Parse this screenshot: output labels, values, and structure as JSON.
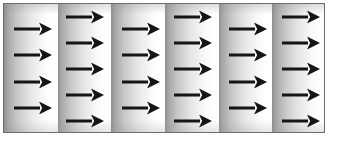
{
  "figure": {
    "kind": "vector-field-diagram",
    "title": "",
    "caption": "",
    "labels": [],
    "annotations": [],
    "frame": {
      "border_color": "#6e6e6e",
      "border_width_px": 1,
      "x_px": 3,
      "y_px": 3,
      "width_px": 322,
      "height_px": 130
    },
    "background": {
      "page_color": "#ffffff",
      "gradient_type": "repeating-linear-horizontal",
      "gradient_dark": "#8f8f8f",
      "gradient_light": "#ffffff",
      "gradient_period_px": 53.67,
      "gradient_repeats": 6
    },
    "arrow": {
      "color": "#151515",
      "direction": "right",
      "direction_degrees": 0,
      "length_px": 38,
      "head_height_px": 13,
      "shaft_height_px": 3,
      "icon": "arrow-right-icon"
    },
    "grid": {
      "columns": 6,
      "column_arrow_counts": [
        4,
        5,
        4,
        5,
        4,
        5
      ],
      "column_x_px": [
        13,
        65,
        121,
        173,
        228,
        281
      ],
      "column_offset_pattern": [
        "low",
        "high",
        "low",
        "high",
        "low",
        "high"
      ],
      "row_spacing_px": 26.4,
      "rows_low_y_px": [
        28,
        54,
        81,
        107
      ],
      "rows_high_y_px": [
        16,
        42,
        68,
        94,
        120
      ],
      "total_arrows": 27
    },
    "arrows": [
      {
        "column": 1,
        "row": 1,
        "x_px": 13,
        "y_px": 28,
        "angle_deg": 0
      },
      {
        "column": 1,
        "row": 2,
        "x_px": 13,
        "y_px": 54,
        "angle_deg": 0
      },
      {
        "column": 1,
        "row": 3,
        "x_px": 13,
        "y_px": 81,
        "angle_deg": 0
      },
      {
        "column": 1,
        "row": 4,
        "x_px": 13,
        "y_px": 107,
        "angle_deg": 0
      },
      {
        "column": 2,
        "row": 1,
        "x_px": 65,
        "y_px": 16,
        "angle_deg": 0
      },
      {
        "column": 2,
        "row": 2,
        "x_px": 65,
        "y_px": 42,
        "angle_deg": 0
      },
      {
        "column": 2,
        "row": 3,
        "x_px": 65,
        "y_px": 68,
        "angle_deg": 0
      },
      {
        "column": 2,
        "row": 4,
        "x_px": 65,
        "y_px": 94,
        "angle_deg": 0
      },
      {
        "column": 2,
        "row": 5,
        "x_px": 65,
        "y_px": 120,
        "angle_deg": 0
      },
      {
        "column": 3,
        "row": 1,
        "x_px": 121,
        "y_px": 28,
        "angle_deg": 0
      },
      {
        "column": 3,
        "row": 2,
        "x_px": 121,
        "y_px": 54,
        "angle_deg": 0
      },
      {
        "column": 3,
        "row": 3,
        "x_px": 121,
        "y_px": 81,
        "angle_deg": 0
      },
      {
        "column": 3,
        "row": 4,
        "x_px": 121,
        "y_px": 107,
        "angle_deg": 0
      },
      {
        "column": 4,
        "row": 1,
        "x_px": 173,
        "y_px": 16,
        "angle_deg": 0
      },
      {
        "column": 4,
        "row": 2,
        "x_px": 173,
        "y_px": 42,
        "angle_deg": 0
      },
      {
        "column": 4,
        "row": 3,
        "x_px": 173,
        "y_px": 68,
        "angle_deg": 0
      },
      {
        "column": 4,
        "row": 4,
        "x_px": 173,
        "y_px": 94,
        "angle_deg": 0
      },
      {
        "column": 4,
        "row": 5,
        "x_px": 173,
        "y_px": 120,
        "angle_deg": 0
      },
      {
        "column": 5,
        "row": 1,
        "x_px": 228,
        "y_px": 28,
        "angle_deg": 0
      },
      {
        "column": 5,
        "row": 2,
        "x_px": 228,
        "y_px": 54,
        "angle_deg": 0
      },
      {
        "column": 5,
        "row": 3,
        "x_px": 228,
        "y_px": 81,
        "angle_deg": 0
      },
      {
        "column": 5,
        "row": 4,
        "x_px": 228,
        "y_px": 107,
        "angle_deg": 0
      },
      {
        "column": 6,
        "row": 1,
        "x_px": 281,
        "y_px": 16,
        "angle_deg": 0
      },
      {
        "column": 6,
        "row": 2,
        "x_px": 281,
        "y_px": 42,
        "angle_deg": 0
      },
      {
        "column": 6,
        "row": 3,
        "x_px": 281,
        "y_px": 68,
        "angle_deg": 0
      },
      {
        "column": 6,
        "row": 4,
        "x_px": 281,
        "y_px": 94,
        "angle_deg": 0
      },
      {
        "column": 6,
        "row": 5,
        "x_px": 281,
        "y_px": 120,
        "angle_deg": 0
      }
    ]
  }
}
